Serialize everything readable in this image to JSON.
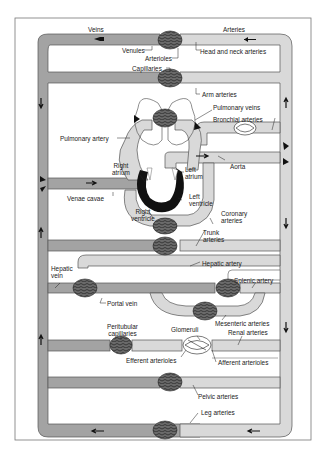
{
  "colors": {
    "vein": "#a3a3a3",
    "artery": "#d9d9d9",
    "capillary": "#6a6a6a",
    "heart": "#111111",
    "outline": "#555555",
    "frame": "#777777"
  },
  "headers": {
    "veins": "Veins",
    "arteries": "Arteries"
  },
  "labels": {
    "venules": "Venules",
    "arterioles": "Arterioles",
    "head_neck_arteries": "Head and neck  arteries",
    "capillaries": "Capillaries",
    "arm_arteries": "Arm arteries",
    "pulmonary_veins": "Pulmonary veins",
    "bronchial_arteries": "Bronchial arteries",
    "pulmonary_artery": "Pulmonary artery",
    "aorta": "Aorta",
    "right_atrium_1": "Right",
    "right_atrium_2": "atrium",
    "left_atrium_1": "Left",
    "left_atrium_2": "atrium",
    "venae_cavae": "Venae cavae",
    "left_ventricle_1": "Left",
    "left_ventricle_2": "ventricle",
    "right_ventricle_1": "Right",
    "right_ventricle_2": "ventricle",
    "coronary_arteries_1": "Coronary",
    "coronary_arteries_2": "arteries",
    "trunk_arteries_1": "Trunk",
    "trunk_arteries_2": "arteries",
    "hepatic_artery": "Hepatic artery",
    "hepatic_vein_1": "Hepatic",
    "hepatic_vein_2": "vein",
    "splenic_artery": "Splenic artery",
    "portal_vein": "Portal vein",
    "mesenteric_arteries": "Mesenteric arteries",
    "peritubular_capillaries_1": "Peritubular",
    "peritubular_capillaries_2": "capillaries",
    "glomeruli": "Glomeruli",
    "renal_arteries": "Renal arteries",
    "efferent_arterioles": "Efferent arterioles",
    "afferent_arterioles": "Afferent arterioles",
    "pelvic_arteries": "Pelvic arteries",
    "leg_arteries": "Leg arteries"
  }
}
